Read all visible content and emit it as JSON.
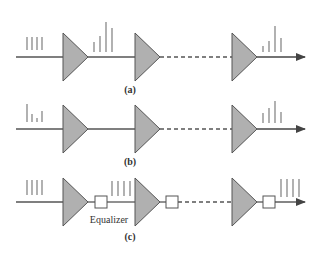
{
  "colors": {
    "line": "#555555",
    "amplifier_fill": "#b0b0b0",
    "amplifier_stroke": "#555555",
    "pulse": "#888888",
    "equalizer_fill": "#ffffff",
    "text": "#333333"
  },
  "rows": [
    {
      "label": "(a)",
      "description": "Transmission line with amplifiers; pulses distort progressively",
      "input_pulses": [
        13,
        13,
        13,
        13
      ],
      "mid_pulses": [
        8,
        14,
        23,
        17
      ],
      "output_pulses": [
        6,
        10,
        26,
        14
      ],
      "has_equalizer": false
    },
    {
      "label": "(b)",
      "description": "Distorted input pulses through amplifiers",
      "input_pulses": [
        16,
        8,
        4,
        10
      ],
      "output_pulses": [
        9,
        13,
        16,
        9
      ],
      "has_equalizer": false
    },
    {
      "label": "(c)",
      "description": "Amplifiers followed by equalizers restore pulse shape",
      "input_pulses": [
        13,
        13,
        13,
        13
      ],
      "mid_pulses": [
        13,
        13,
        13,
        13
      ],
      "output_pulses": [
        13,
        13,
        13,
        13
      ],
      "has_equalizer": true,
      "equalizer_label": "Equalizer"
    }
  ]
}
